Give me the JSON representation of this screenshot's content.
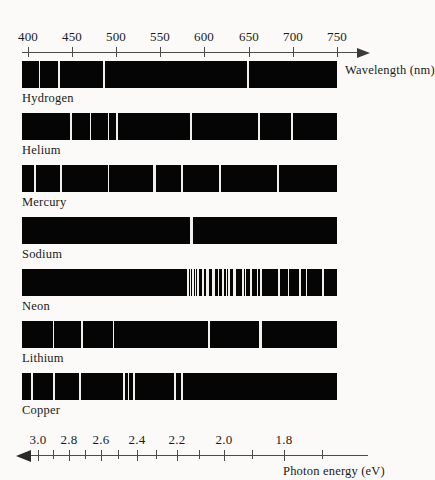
{
  "figure": {
    "background_color": "#fbfaf8",
    "band_color": "#050505",
    "line_color": "#f2f0ec"
  },
  "wavelength_axis": {
    "caption": "Wavelength (nm)",
    "unit": "nm",
    "position": "top",
    "direction": "right",
    "range": [
      390,
      760
    ],
    "ticks": [
      {
        "label": "400",
        "value": 400
      },
      {
        "label": "450",
        "value": 450
      },
      {
        "label": "500",
        "value": 500
      },
      {
        "label": "550",
        "value": 550
      },
      {
        "label": "600",
        "value": 600
      },
      {
        "label": "650",
        "value": 650
      },
      {
        "label": "700",
        "value": 700
      },
      {
        "label": "750",
        "value": 750
      }
    ]
  },
  "energy_axis": {
    "caption": "Photon energy (eV)",
    "unit": "eV",
    "position": "bottom",
    "direction": "left",
    "labeled_ticks": [
      {
        "label": "3.0",
        "value": 3.0
      },
      {
        "label": "2.8",
        "value": 2.8
      },
      {
        "label": "2.6",
        "value": 2.6
      },
      {
        "label": "2.4",
        "value": 2.4
      },
      {
        "label": "2.2",
        "value": 2.2
      },
      {
        "label": "2.0",
        "value": 2.0
      },
      {
        "label": "1.8",
        "value": 1.8
      }
    ],
    "minor_ticks": [
      2.9,
      2.7,
      2.5,
      2.3,
      2.1,
      1.9,
      1.7,
      1.65
    ]
  },
  "chart_data": {
    "type": "line",
    "xlabel": "Wavelength (nm)",
    "ylabel": "",
    "xlim": [
      390,
      760
    ],
    "secondary_xlabel": "Photon energy (eV)",
    "legend": "none",
    "grid": false,
    "categories": [
      "Hydrogen",
      "Helium",
      "Mercury",
      "Sodium",
      "Neon",
      "Lithium",
      "Copper"
    ],
    "series": [
      {
        "name": "Hydrogen",
        "label": "Hydrogen",
        "lines_nm": [
          410,
          434,
          486,
          656
        ],
        "line_widths": [
          1,
          2,
          2,
          2
        ]
      },
      {
        "name": "Helium",
        "label": "Helium",
        "lines_nm": [
          447,
          471,
          492,
          502,
          588,
          668,
          707
        ],
        "line_widths": [
          2,
          1,
          1,
          2,
          2,
          2,
          2
        ]
      },
      {
        "name": "Mercury",
        "label": "Mercury",
        "lines_nm": [
          405,
          436,
          492,
          546,
          577,
          579,
          623,
          691
        ],
        "line_widths": [
          2,
          2,
          1,
          3,
          1,
          1,
          2,
          2
        ]
      },
      {
        "name": "Sodium",
        "label": "Sodium",
        "lines_nm": [
          589
        ],
        "line_widths": [
          3
        ]
      },
      {
        "name": "Neon",
        "label": "Neon",
        "lines_nm": [
          585,
          588,
          591,
          594,
          597,
          603,
          607,
          609,
          614,
          616,
          621,
          626,
          630,
          633,
          638,
          640,
          650,
          653,
          659,
          667,
          671,
          692,
          703,
          717,
          724,
          743
        ],
        "line_widths": [
          2,
          1,
          2,
          1,
          2,
          2,
          1,
          2,
          1,
          2,
          1,
          2,
          1,
          2,
          1,
          2,
          2,
          1,
          2,
          1,
          2,
          2,
          1,
          2,
          1,
          2
        ]
      },
      {
        "name": "Lithium",
        "label": "Lithium",
        "lines_nm": [
          427,
          460,
          497,
          610,
          670
        ],
        "line_widths": [
          1,
          2,
          1,
          2,
          3
        ]
      },
      {
        "name": "Copper",
        "label": "Copper",
        "lines_nm": [
          402,
          427,
          458,
          510,
          515,
          522,
          570,
          578
        ],
        "line_widths": [
          2,
          2,
          2,
          2,
          1,
          2,
          2,
          2
        ]
      }
    ]
  }
}
